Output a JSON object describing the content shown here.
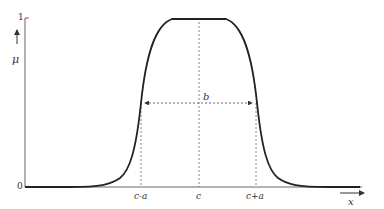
{
  "diagram": {
    "type": "generalized-bell-membership-function",
    "y_axis": {
      "label": "μ",
      "ticks": [
        "1",
        "0"
      ]
    },
    "x_axis": {
      "label": "x",
      "ticks": [
        "c-a",
        "c",
        "c+a"
      ]
    },
    "width_annotation": "b",
    "colors": {
      "curve": "#222222",
      "axes": "#555555",
      "guides": "#666666"
    }
  }
}
